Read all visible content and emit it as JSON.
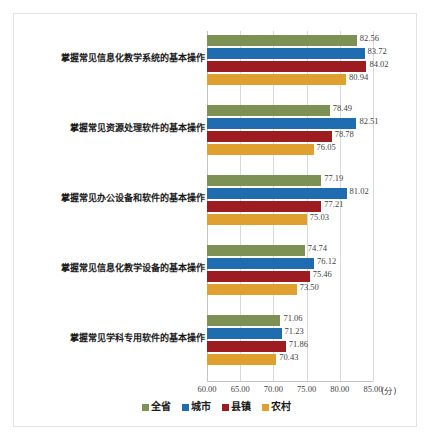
{
  "chart_data": {
    "type": "bar",
    "orientation": "horizontal",
    "title": "",
    "xlabel": "(分)",
    "ylabel": "",
    "xlim": [
      60.0,
      85.0
    ],
    "xticks": [
      "60.00",
      "65.00",
      "70.00",
      "75.00",
      "80.00",
      "85.00"
    ],
    "xtick_values": [
      60.0,
      65.0,
      70.0,
      75.0,
      80.0,
      85.0
    ],
    "grid": true,
    "legend_position": "bottom",
    "categories": [
      "掌握常见信息化教学系统的基本操作",
      "掌握常见资源处理软件的基本操作",
      "掌握常见办公设备和软件的基本操作",
      "掌握常见信息化教学设备的基本操作",
      "掌握常见学科专用软件的基本操作"
    ],
    "series": [
      {
        "name": "全省",
        "color": "#7d9154",
        "values": [
          82.56,
          78.49,
          77.19,
          74.74,
          71.06
        ],
        "labels": [
          "82.56",
          "78.49",
          "77.19",
          "74.74",
          "71.06"
        ]
      },
      {
        "name": "城市",
        "color": "#1f6cb0",
        "values": [
          83.72,
          82.51,
          81.02,
          76.12,
          71.23
        ],
        "labels": [
          "83.72",
          "82.51",
          "81.02",
          "76.12",
          "71.23"
        ]
      },
      {
        "name": "县镇",
        "color": "#9d1c21",
        "values": [
          84.02,
          78.78,
          77.21,
          75.46,
          71.86
        ],
        "labels": [
          "84.02",
          "78.78",
          "77.21",
          "75.46",
          "71.86"
        ]
      },
      {
        "name": "农村",
        "color": "#e0a030",
        "values": [
          80.94,
          76.05,
          75.03,
          73.5,
          70.43
        ],
        "labels": [
          "80.94",
          "76.05",
          "75.03",
          "73.50",
          "70.43"
        ]
      }
    ]
  },
  "colors": {
    "grid": "#d9d9d9",
    "axis": "#c4c4c4",
    "border": "#e3e3e3",
    "text": "#3f3f3f",
    "category_text": "#1a1a1a"
  }
}
